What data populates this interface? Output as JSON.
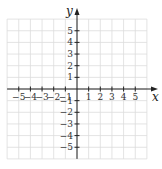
{
  "chart_data": {
    "type": "scatter",
    "title": "",
    "xlabel": "x",
    "ylabel": "y",
    "xlim": [
      -6,
      6
    ],
    "ylim": [
      -6,
      6
    ],
    "grid": true,
    "x_ticks": [
      -5,
      -4,
      -3,
      -2,
      -1,
      1,
      2,
      3,
      4,
      5
    ],
    "y_ticks": [
      5,
      4,
      3,
      2,
      1,
      -1,
      -2,
      -3,
      -4,
      -5
    ],
    "x_tick_labels": [
      "−5",
      "−4",
      "−3",
      "−2",
      "−1",
      "1",
      "2",
      "3",
      "4",
      "5"
    ],
    "y_tick_labels": [
      "5",
      "4",
      "3",
      "2",
      "1",
      "−1",
      "−2",
      "−3",
      "−4",
      "−5"
    ],
    "series": []
  },
  "colors": {
    "grid": "#dcdcdc",
    "axis": "#222222"
  }
}
